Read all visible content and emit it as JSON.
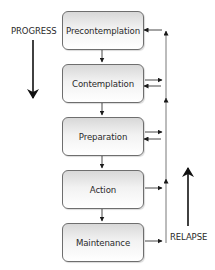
{
  "diagram": {
    "stages": [
      {
        "label": "Precontemplation"
      },
      {
        "label": "Contemplation"
      },
      {
        "label": "Preparation"
      },
      {
        "label": "Action"
      },
      {
        "label": "Maintenance"
      }
    ],
    "progress_label": "PROGRESS",
    "relapse_label": "RELAPSE",
    "colors": {
      "box_border": "#6e6e6e",
      "box_fill_top": "#d8d8d8",
      "box_fill_bottom": "#ffffff",
      "text": "#2a2a2a",
      "arrow": "#1a1a1a",
      "relapse_line": "#555555"
    }
  }
}
